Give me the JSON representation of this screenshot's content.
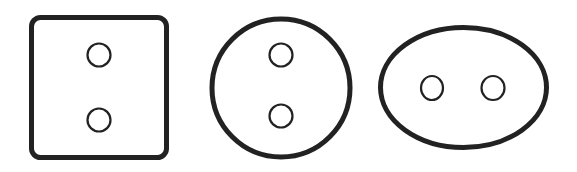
{
  "diagram": {
    "type": "plug-shapes",
    "stroke_color": "#222222",
    "background": "#ffffff",
    "shapes": [
      {
        "name": "square",
        "label": "Square plug face",
        "kind": "rounded-rect",
        "x": 31.5,
        "y": 17.5,
        "width": 135,
        "height": 140,
        "rx": 9,
        "stroke_width": 5,
        "holes": [
          {
            "cx": 99,
            "cy": 55,
            "r": 11.5
          },
          {
            "cx": 99,
            "cy": 120,
            "r": 11.5
          }
        ]
      },
      {
        "name": "circle",
        "label": "Round plug face",
        "kind": "circle",
        "cx": 281,
        "cy": 88,
        "r": 69,
        "stroke_width": 5,
        "holes": [
          {
            "cx": 281,
            "cy": 55,
            "r": 11.5
          },
          {
            "cx": 281,
            "cy": 116,
            "r": 11.5
          }
        ]
      },
      {
        "name": "oval",
        "label": "Oval plug face",
        "kind": "ellipse",
        "cx": 463.5,
        "cy": 87.5,
        "rx": 83,
        "ry": 60,
        "stroke_width": 5,
        "holes": [
          {
            "cx": 432,
            "cy": 88,
            "rx": 11,
            "ry": 12
          },
          {
            "cx": 493,
            "cy": 88,
            "rx": 11.5,
            "ry": 12
          }
        ]
      }
    ]
  }
}
